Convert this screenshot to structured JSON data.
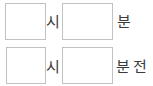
{
  "form": {
    "name": "time-entry-form",
    "rows": [
      {
        "id": "hour-row",
        "hour_value": "",
        "hour_placeholder": "",
        "hour_unit": "시",
        "minute_value": "",
        "minute_placeholder": "",
        "minute_unit": "분",
        "suffix": ""
      },
      {
        "id": "minute-ago-row",
        "hour_value": "",
        "hour_placeholder": "",
        "hour_unit": "시",
        "minute_value": "",
        "minute_placeholder": "",
        "minute_unit": "분",
        "suffix": "전"
      }
    ]
  },
  "colors": {
    "background": "#ffffff",
    "field_border": "#c2c2c2",
    "field_background": "#ffffff",
    "label_text": "#3a3a3a"
  }
}
